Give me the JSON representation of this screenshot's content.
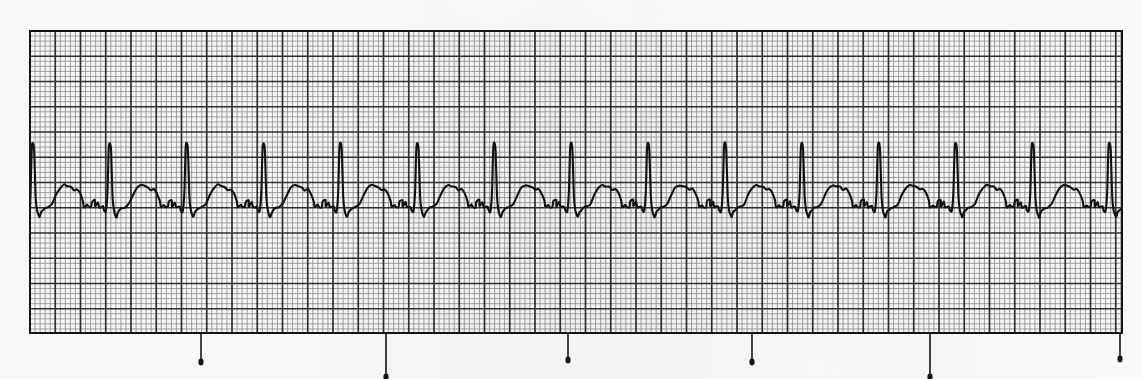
{
  "document": {
    "type": "ecg-rhythm-strip",
    "title": "ECG Rhythm Strip",
    "lead_label": "",
    "annotations": []
  },
  "grid": {
    "x": 30,
    "y": 31,
    "width": 1092,
    "height": 302,
    "small_box_px": 5.05,
    "large_box_px": 25.25,
    "small_line_color": "#4a4a4a",
    "large_line_color": "#1c1c1c",
    "paper_color": "#fbfbf9",
    "small_line_width": 0.8,
    "large_line_width": 1.7,
    "border_color": "#141414",
    "border_width": 2.0
  },
  "trace": {
    "color": "#111111",
    "line_width": 2.1,
    "baseline_y": 206,
    "start_x": 30,
    "end_x": 1122,
    "beat_count": 15,
    "rr_interval_px": 76.9,
    "first_r_peak_x": 33,
    "r_peak_y": 143,
    "s_trough_y": 217,
    "t_wave_peak_y": 186,
    "q_dip_y": 210,
    "p_wave_peak_y": 201,
    "r_peaks_x": [
      33,
      110,
      187,
      264,
      340,
      417,
      494,
      571,
      647,
      724,
      801,
      878,
      954,
      1031,
      1108
    ]
  },
  "time_markers": {
    "label": "3-second interval markers",
    "color": "#151515",
    "stem_width": 1.6,
    "top_y": 333,
    "positions": [
      {
        "x": 201,
        "length": 29
      },
      {
        "x": 386,
        "length": 44
      },
      {
        "x": 568,
        "length": 27
      },
      {
        "x": 752,
        "length": 29
      },
      {
        "x": 930,
        "length": 44
      },
      {
        "x": 1120,
        "length": 26
      }
    ]
  },
  "chart_data": {
    "type": "line",
    "xlabel": "Time",
    "ylabel": "Amplitude (mV)",
    "grid": true,
    "legend": "none",
    "x_unit_per_small_box": "0.04 s",
    "y_unit_per_small_box": "0.1 mV",
    "rhythm": "regular sinus rhythm",
    "beats": 15,
    "series": [
      {
        "name": "ECG Lead II",
        "beat_morphology": {
          "p_wave_mv": 0.1,
          "q_wave_mv": -0.05,
          "r_wave_mv": 1.25,
          "s_wave_mv": -0.22,
          "t_wave_mv": 0.4
        }
      }
    ]
  }
}
